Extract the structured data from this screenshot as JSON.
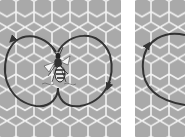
{
  "figure": {
    "colors": {
      "comb_fill": "#a9a9a9",
      "comb_lines": "#f2f2f2",
      "path_stroke": "#333333",
      "background": "#ffffff"
    },
    "panels": [
      {
        "id": "left",
        "depicts": "waggle dance figure-eight path",
        "elements": [
          "honeycomb-background",
          "figure-eight-path",
          "direction-arrow-top-left",
          "direction-arrow-right",
          "bee"
        ]
      },
      {
        "id": "right",
        "depicts": "round dance circular path (cropped)",
        "elements": [
          "honeycomb-background",
          "circular-path",
          "direction-arrow-left"
        ]
      }
    ]
  }
}
